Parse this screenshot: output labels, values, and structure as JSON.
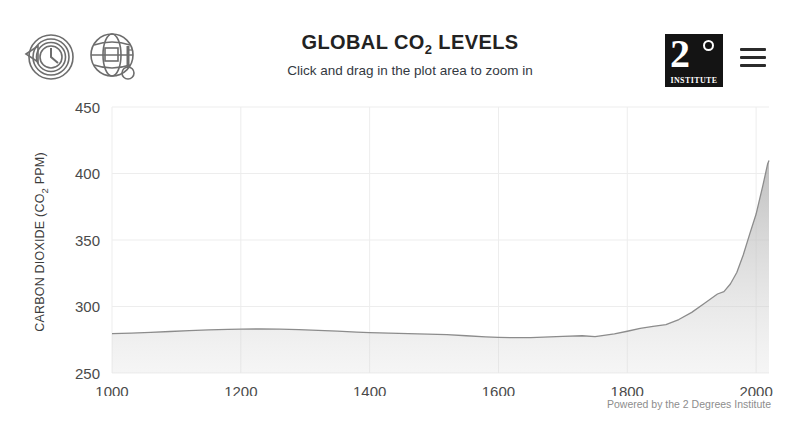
{
  "header": {
    "title_main": "GLOBAL CO",
    "title_sub": "2",
    "title_tail": " LEVELS",
    "subtitle": "Click and drag in the plot area to zoom in",
    "icon_history": "clock-history-icon",
    "icon_climate": "globe-thermometer-icon",
    "logo_number": "2",
    "logo_degree_symbol": "°",
    "logo_name": "INSTITUTE",
    "menu_icon": "hamburger-menu-icon"
  },
  "footer": {
    "credit": "Powered by the 2 Degrees Institute"
  },
  "chart_data": {
    "type": "area",
    "title": "GLOBAL CO2 LEVELS",
    "subtitle": "Click and drag in the plot area to zoom in",
    "xlabel": "",
    "ylabel": "CARBON DIOXIDE (CO2 PPM)",
    "ylabel_main": "CARBON DIOXIDE (CO",
    "ylabel_sub": "2",
    "ylabel_tail": " PPM)",
    "xlim": [
      1000,
      2020
    ],
    "ylim": [
      250,
      450
    ],
    "xticks": [
      1000,
      1200,
      1400,
      1600,
      1800,
      2000
    ],
    "yticks": [
      250,
      300,
      350,
      400,
      450
    ],
    "xtick_labels": [
      "1000",
      "1200",
      "1400",
      "1600",
      "1800",
      "2000"
    ],
    "ytick_labels": [
      "250",
      "300",
      "350",
      "400",
      "450"
    ],
    "grid": true,
    "legend": false,
    "line_color": "#8c8c8c",
    "fill_color": "#c8c8c8",
    "grid_color": "#ededed",
    "series": [
      {
        "name": "Atmospheric CO2",
        "x": [
          1000,
          1030,
          1060,
          1090,
          1120,
          1150,
          1180,
          1200,
          1230,
          1260,
          1290,
          1320,
          1350,
          1380,
          1400,
          1430,
          1460,
          1490,
          1520,
          1550,
          1580,
          1600,
          1620,
          1650,
          1680,
          1700,
          1730,
          1750,
          1780,
          1800,
          1820,
          1840,
          1860,
          1880,
          1900,
          1920,
          1940,
          1950,
          1960,
          1970,
          1980,
          1990,
          2000,
          2005,
          2010,
          2015,
          2018,
          2020
        ],
        "y": [
          279.6,
          280.0,
          280.6,
          281.2,
          281.9,
          282.4,
          282.8,
          283.0,
          283.1,
          283.0,
          282.6,
          282.1,
          281.5,
          280.8,
          280.4,
          280.0,
          279.6,
          279.2,
          278.8,
          278.0,
          277.2,
          276.8,
          276.6,
          276.6,
          277.2,
          277.6,
          278.0,
          277.4,
          279.4,
          281.4,
          283.6,
          285.0,
          286.4,
          290.2,
          295.6,
          302.5,
          309.4,
          311.2,
          316.9,
          325.6,
          338.7,
          354.4,
          369.5,
          379.8,
          389.9,
          400.8,
          407.4,
          409.8
        ]
      }
    ]
  }
}
